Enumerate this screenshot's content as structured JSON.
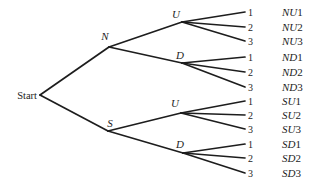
{
  "page": {
    "background": "#ffffff"
  },
  "diagram": {
    "type": "probability-tree",
    "stroke_color": "#1d1d1d",
    "stroke_width": 1.7,
    "text_color": "#1d1d1d",
    "root": {
      "id": "start",
      "label": "Start",
      "vx": 40,
      "vy": 95,
      "label_x": 37,
      "label_y": 98.5,
      "label_anchor": "end",
      "italic": false
    },
    "nodes": [
      {
        "id": "N",
        "label": "N",
        "parent": "start",
        "vx": 109,
        "vy": 47,
        "label_x": 105,
        "label_y": 40,
        "label_anchor": "middle",
        "italic": true
      },
      {
        "id": "S",
        "label": "S",
        "parent": "start",
        "vx": 108,
        "vy": 131,
        "label_x": 110,
        "label_y": 127,
        "label_anchor": "middle",
        "italic": true
      },
      {
        "id": "NU",
        "label": "U",
        "parent": "N",
        "vx": 182,
        "vy": 22,
        "label_x": 176,
        "label_y": 18,
        "label_anchor": "middle",
        "italic": true
      },
      {
        "id": "ND",
        "label": "D",
        "parent": "N",
        "vx": 182,
        "vy": 63,
        "label_x": 180,
        "label_y": 59,
        "label_anchor": "middle",
        "italic": true
      },
      {
        "id": "SU",
        "label": "U",
        "parent": "S",
        "vx": 181,
        "vy": 113,
        "label_x": 175,
        "label_y": 107,
        "label_anchor": "middle",
        "italic": true
      },
      {
        "id": "SD",
        "label": "D",
        "parent": "S",
        "vx": 183,
        "vy": 153,
        "label_x": 180,
        "label_y": 148,
        "label_anchor": "middle",
        "italic": true
      }
    ],
    "leaf_layout": {
      "line_end_x": 245,
      "digit_x": 248,
      "outcome_x": 282,
      "digit_font_size": 10,
      "outcome_font_size": 11,
      "node_font_size": 11,
      "root_font_size": 10.5
    },
    "leaves": [
      {
        "parent": "NU",
        "digit": "1",
        "outcome": "NU1",
        "y": 12
      },
      {
        "parent": "NU",
        "digit": "2",
        "outcome": "NU2",
        "y": 27
      },
      {
        "parent": "NU",
        "digit": "3",
        "outcome": "NU3",
        "y": 41
      },
      {
        "parent": "ND",
        "digit": "1",
        "outcome": "ND1",
        "y": 57
      },
      {
        "parent": "ND",
        "digit": "2",
        "outcome": "ND2",
        "y": 72
      },
      {
        "parent": "ND",
        "digit": "3",
        "outcome": "ND3",
        "y": 87
      },
      {
        "parent": "SU",
        "digit": "1",
        "outcome": "SU1",
        "y": 101
      },
      {
        "parent": "SU",
        "digit": "2",
        "outcome": "SU2",
        "y": 115
      },
      {
        "parent": "SU",
        "digit": "3",
        "outcome": "SU3",
        "y": 129
      },
      {
        "parent": "SD",
        "digit": "1",
        "outcome": "SD1",
        "y": 144
      },
      {
        "parent": "SD",
        "digit": "2",
        "outcome": "SD2",
        "y": 158
      },
      {
        "parent": "SD",
        "digit": "3",
        "outcome": "SD3",
        "y": 173
      }
    ]
  }
}
